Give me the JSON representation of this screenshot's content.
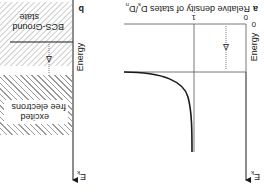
{
  "panel_a": {
    "letter": "a",
    "title": "Relative density of states D",
    "title_sub_s": "s",
    "title_slash": "/D",
    "title_sub_n": "n",
    "x_tick_0": "0",
    "x_tick_1": "1",
    "y_tick_0": "0",
    "y_axis_label": "Energy",
    "y_axis_symbol": "E",
    "y_axis_symbol_sub": "k",
    "gap_label": "Δ"
  },
  "panel_b": {
    "letter": "b",
    "ground_label_line1": "BCS-Ground",
    "ground_label_line2": "state",
    "gap_label": "Δ",
    "excited_label_line1": "excited",
    "excited_label_line2": "free electrons",
    "y_axis_label": "Energy",
    "y_axis_symbol": "E",
    "y_axis_symbol_sub": "k"
  },
  "colors": {
    "line": "#1a1a1a",
    "thin_line": "#555555",
    "hatch": "#9a9a9a"
  }
}
